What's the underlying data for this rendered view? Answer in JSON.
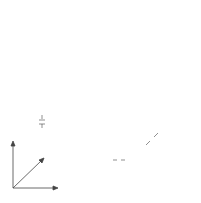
{
  "labels": {
    "eta_axis": "η",
    "xi_axis": "ξ",
    "zeta_axis": "ζ",
    "delta_eta": "Δη",
    "delta_xi": "Δξ",
    "delta_zeta": "Δζ"
  },
  "grid": {
    "front_cells_x": 15,
    "front_cells_y": 16,
    "depth_layers": 10
  },
  "colors": {
    "line": "#555555",
    "background": "#ffffff"
  }
}
